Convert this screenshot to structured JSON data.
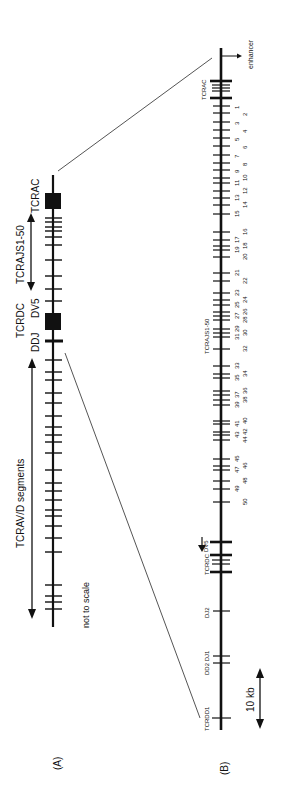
{
  "panel_a": {
    "label": "(A)",
    "note": "not to scale",
    "segments_label": "TCRAV/D segments",
    "tcraj_label": "TCRAJS1-50",
    "tcrac_label": "TCRAC",
    "tcrdc_label": "TCRDC",
    "dv5_label": "DV5",
    "ddj_label": "DDJ",
    "ticks_v_segments": [
      360,
      372,
      380,
      393,
      403,
      416,
      427,
      435,
      442,
      453,
      470,
      483,
      491,
      500,
      510,
      516,
      526,
      538,
      552,
      585,
      596,
      602,
      609
    ],
    "ticks_j_region": [
      218,
      222,
      227,
      231,
      237,
      245,
      260,
      276,
      289,
      301
    ]
  },
  "panel_b": {
    "label": "(B)",
    "scale_label": "10 kb",
    "enhancer_label": "enhancer",
    "tcrac_label": "TCRAC",
    "tcraj_label": "TCRAJS1-50",
    "tcrdc_label": "TCRDC",
    "dv5_label": "DV5",
    "dj2_label": "DJ2",
    "dd2_dj1_label": "DD2 DJ1",
    "tcrdd1_label": "TCRDD1",
    "j_segments": [
      {
        "n": "1",
        "y": 106
      },
      {
        "n": "2",
        "y": 113
      },
      {
        "n": "3",
        "y": 122
      },
      {
        "n": "4",
        "y": 130
      },
      {
        "n": "5",
        "y": 138
      },
      {
        "n": "6",
        "y": 146
      },
      {
        "n": "7",
        "y": 155
      },
      {
        "n": "8",
        "y": 163
      },
      {
        "n": "9",
        "y": 170
      },
      {
        "n": "10",
        "y": 178
      },
      {
        "n": "11",
        "y": 183
      },
      {
        "n": "12",
        "y": 191
      },
      {
        "n": "13",
        "y": 198
      },
      {
        "n": "14",
        "y": 205
      },
      {
        "n": "15",
        "y": 214
      },
      {
        "n": "16",
        "y": 232
      },
      {
        "n": "17",
        "y": 240
      },
      {
        "n": "18",
        "y": 246
      },
      {
        "n": "19",
        "y": 250
      },
      {
        "n": "20",
        "y": 257
      },
      {
        "n": "21",
        "y": 273
      },
      {
        "n": "22",
        "y": 281
      },
      {
        "n": "23",
        "y": 293
      },
      {
        "n": "24",
        "y": 300
      },
      {
        "n": "25",
        "y": 305
      },
      {
        "n": "26",
        "y": 312
      },
      {
        "n": "27",
        "y": 316
      },
      {
        "n": "28",
        "y": 320
      },
      {
        "n": "29",
        "y": 329
      },
      {
        "n": "30",
        "y": 333
      },
      {
        "n": "31",
        "y": 337
      },
      {
        "n": "32",
        "y": 349
      },
      {
        "n": "33",
        "y": 366
      },
      {
        "n": "34",
        "y": 374
      },
      {
        "n": "35",
        "y": 378
      },
      {
        "n": "36",
        "y": 391
      },
      {
        "n": "37",
        "y": 395
      },
      {
        "n": "38",
        "y": 400
      },
      {
        "n": "39",
        "y": 405
      },
      {
        "n": "40",
        "y": 421
      },
      {
        "n": "41",
        "y": 424
      },
      {
        "n": "42",
        "y": 432
      },
      {
        "n": "43",
        "y": 435
      },
      {
        "n": "44",
        "y": 440
      },
      {
        "n": "45",
        "y": 459
      },
      {
        "n": "46",
        "y": 466
      },
      {
        "n": "47",
        "y": 470
      },
      {
        "n": "48",
        "y": 481
      },
      {
        "n": "49",
        "y": 489
      },
      {
        "n": "50",
        "y": 502
      }
    ]
  },
  "colors": {
    "ink": "#111111",
    "connector": "#555555",
    "background": "#ffffff"
  }
}
